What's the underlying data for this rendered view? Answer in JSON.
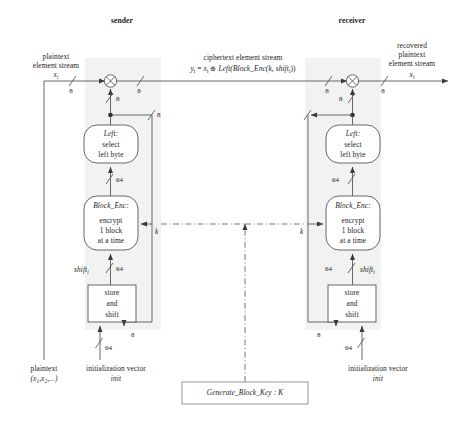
{
  "figure": {
    "title_sender": "sender",
    "title_receiver": "receiver",
    "background": "#ffffff",
    "shade_color": "#f2f2f2",
    "line_color": "#58585a",
    "text_color": "#1c1c1c"
  },
  "sender": {
    "input_label_line1": "plaintext",
    "input_label_line2": "element stream",
    "input_symbol": "x",
    "input_symbol_sub": "i",
    "xor_symbol": "⊕",
    "width_in": "8",
    "width_out": "8",
    "width_feedback": "8",
    "left_box": {
      "name": "Left:",
      "line1": "select",
      "line2": "left byte"
    },
    "enc_box": {
      "name": "Block_Enc:",
      "line1": "encrypt",
      "line2": "1 block",
      "line3": "at a time"
    },
    "shift_box": {
      "line1": "store",
      "line2": "and",
      "line3": "shift"
    },
    "shift_label": "shift",
    "shift_label_sub": "i",
    "width_64_left": "64",
    "width_64_enc": "64",
    "width_64_iv": "64",
    "width_8_shift": "8",
    "key_label": "k",
    "source_label_line1": "plaintext",
    "source_label_line2": "(x",
    "source_label_line2b": ",x",
    "source_label_line2c": ",...)",
    "source_sub1": "1",
    "source_sub2": "2",
    "iv_label_line1": "initialization vector",
    "iv_label_line2": "init"
  },
  "middle": {
    "cipher_label_line1": "ciphertext element stream",
    "cipher_formula_y": "y",
    "cipher_formula_y_sub": "i",
    "cipher_formula_eq": " = ",
    "cipher_formula_x": "x",
    "cipher_formula_x_sub": "i",
    "cipher_formula_xor": " ⊕ ",
    "cipher_formula_fn": "Left(Block_Enc(k, shift",
    "cipher_formula_fn_sub": "i",
    "cipher_formula_fn_end": "))"
  },
  "receiver": {
    "output_label_line1": "recovered",
    "output_label_line2": "plaintext",
    "output_label_line3": "element stream",
    "output_symbol": "x",
    "output_symbol_sub": "i",
    "xor_symbol": "⊕",
    "width_in": "8",
    "width_out": "8",
    "width_feedback": "8",
    "left_box": {
      "name": "Left:",
      "line1": "select",
      "line2": "left byte"
    },
    "enc_box": {
      "name": "Block_Enc:",
      "line1": "encrypt",
      "line2": "1 block",
      "line3": "at a time"
    },
    "shift_box": {
      "line1": "store",
      "line2": "and",
      "line3": "shift"
    },
    "shift_label": "shift",
    "shift_label_sub": "i",
    "width_64_left": "64",
    "width_64_enc": "64",
    "width_64_iv": "64",
    "width_8_shift": "8",
    "key_label": "k",
    "iv_label_line1": "initialization vector",
    "iv_label_line2": "init"
  },
  "keygen": {
    "label": "Generate_Block_Key : ",
    "key_symbol": "K"
  }
}
